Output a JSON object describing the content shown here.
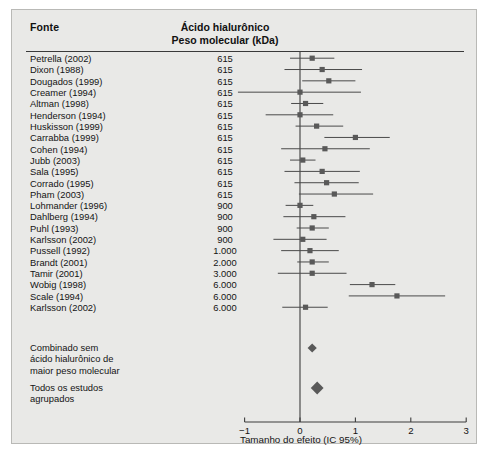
{
  "figure": {
    "background": "#e9e9e7",
    "border_color": "#b9b9b6",
    "marker_color": "#595959",
    "line_color": "#4a4a4a"
  },
  "header": {
    "col_source": "Fonte",
    "col_mw_line1": "Ácido hialurônico",
    "col_mw_line2": "Peso molecular (kDa)"
  },
  "summary": {
    "pooled_excluding_label": "Combinado sem\nácido hialurônico de\nmaior peso molecular",
    "pooled_all_label": "Todos os estudos\nagrupados"
  },
  "axis": {
    "title": "Tamanho do efeito (IC 95%)",
    "ticks": [
      "−1",
      "0",
      "1",
      "2",
      "3"
    ],
    "tick_values": [
      -1,
      0,
      1,
      2,
      3
    ],
    "min": -1,
    "max": 3,
    "null_line": 0
  },
  "chart_data": {
    "type": "forest",
    "title": "",
    "xlabel": "Tamanho do efeito (IC 95%)",
    "ylabel": "Fonte",
    "xlim": [
      -1,
      3
    ],
    "xticks": [
      -1,
      0,
      1,
      2,
      3
    ],
    "grid": false,
    "legend": "none",
    "null_line": 0,
    "columns": [
      "Fonte",
      "Ácido hialurônico Peso molecular (kDa)"
    ],
    "studies": [
      {
        "label": "Petrella (2002)",
        "mw": "615",
        "effect": 0.22,
        "ci_low": -0.18,
        "ci_high": 0.62
      },
      {
        "label": "Dixon (1988)",
        "mw": "615",
        "effect": 0.4,
        "ci_low": -0.28,
        "ci_high": 1.12
      },
      {
        "label": "Dougados (1999)",
        "mw": "615",
        "effect": 0.52,
        "ci_low": 0.04,
        "ci_high": 1.0
      },
      {
        "label": "Creamer (1994)",
        "mw": "615",
        "effect": 0.0,
        "ci_low": -1.12,
        "ci_high": 1.1
      },
      {
        "label": "Altman (1998)",
        "mw": "615",
        "effect": 0.1,
        "ci_low": -0.16,
        "ci_high": 0.42
      },
      {
        "label": "Henderson (1994)",
        "mw": "615",
        "effect": 0.0,
        "ci_low": -0.62,
        "ci_high": 0.6
      },
      {
        "label": "Huskisson (1999)",
        "mw": "615",
        "effect": 0.3,
        "ci_low": -0.08,
        "ci_high": 0.78
      },
      {
        "label": "Carrabba (1999)",
        "mw": "615",
        "effect": 1.0,
        "ci_low": 0.44,
        "ci_high": 1.62
      },
      {
        "label": "Cohen (1994)",
        "mw": "615",
        "effect": 0.45,
        "ci_low": -0.34,
        "ci_high": 1.26
      },
      {
        "label": "Jubb (2003)",
        "mw": "615",
        "effect": 0.05,
        "ci_low": -0.18,
        "ci_high": 0.28
      },
      {
        "label": "Sala (1995)",
        "mw": "615",
        "effect": 0.4,
        "ci_low": -0.28,
        "ci_high": 1.08
      },
      {
        "label": "Corrado (1995)",
        "mw": "615",
        "effect": 0.48,
        "ci_low": -0.1,
        "ci_high": 1.06
      },
      {
        "label": "Pham (2003)",
        "mw": "615",
        "effect": 0.62,
        "ci_low": -0.02,
        "ci_high": 1.32
      },
      {
        "label": "Lohmander (1996)",
        "mw": "900",
        "effect": 0.0,
        "ci_low": -0.26,
        "ci_high": 0.24
      },
      {
        "label": "Dahlberg (1994)",
        "mw": "900",
        "effect": 0.25,
        "ci_low": -0.3,
        "ci_high": 0.82
      },
      {
        "label": "Puhl (1993)",
        "mw": "900",
        "effect": 0.22,
        "ci_low": -0.06,
        "ci_high": 0.52
      },
      {
        "label": "Karlsson (2002)",
        "mw": "900",
        "effect": 0.05,
        "ci_low": -0.48,
        "ci_high": 0.48
      },
      {
        "label": "Pussell (1992)",
        "mw": "1.000",
        "effect": 0.18,
        "ci_low": -0.34,
        "ci_high": 0.7
      },
      {
        "label": "Brandt (2001)",
        "mw": "2.000",
        "effect": 0.22,
        "ci_low": -0.05,
        "ci_high": 0.52
      },
      {
        "label": "Tamir (2001)",
        "mw": "3.000",
        "effect": 0.22,
        "ci_low": -0.4,
        "ci_high": 0.84
      },
      {
        "label": "Wobig (1998)",
        "mw": "6.000",
        "effect": 1.3,
        "ci_low": 0.9,
        "ci_high": 1.72
      },
      {
        "label": "Scale (1994)",
        "mw": "6.000",
        "effect": 1.75,
        "ci_low": 0.88,
        "ci_high": 2.62
      },
      {
        "label": "Karlsson (2002)",
        "mw": "6.000",
        "effect": 0.1,
        "ci_low": -0.32,
        "ci_high": 0.5
      }
    ],
    "summaries": [
      {
        "label": "Combinado sem ácido hialurônico de maior peso molecular",
        "effect": 0.22,
        "ci_low": 0.14,
        "ci_high": 0.3
      },
      {
        "label": "Todos os estudos agrupados",
        "effect": 0.31,
        "ci_low": 0.21,
        "ci_high": 0.41
      }
    ]
  }
}
